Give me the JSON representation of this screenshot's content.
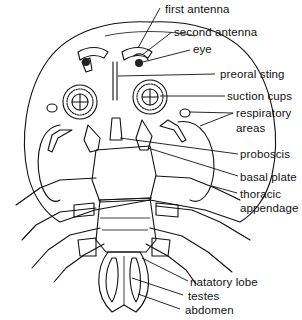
{
  "figure": {
    "labels": [
      {
        "id": "first-antenna",
        "text": "first antenna"
      },
      {
        "id": "second-antenna",
        "text": "second antenna"
      },
      {
        "id": "eye",
        "text": "eye"
      },
      {
        "id": "preoral-sting",
        "text": "preoral sting"
      },
      {
        "id": "suction-cups",
        "text": "suction cups"
      },
      {
        "id": "respiratory-areas-1",
        "text": "respiratory"
      },
      {
        "id": "respiratory-areas-2",
        "text": "areas"
      },
      {
        "id": "proboscis",
        "text": "proboscis"
      },
      {
        "id": "basal-plate",
        "text": "basal plate"
      },
      {
        "id": "thoracic-appendage-1",
        "text": "thoracic"
      },
      {
        "id": "thoracic-appendage-2",
        "text": "appendage"
      },
      {
        "id": "natatory-lobe",
        "text": "natatory lobe"
      },
      {
        "id": "testes",
        "text": "testes"
      },
      {
        "id": "abdomen",
        "text": "abdomen"
      }
    ]
  }
}
